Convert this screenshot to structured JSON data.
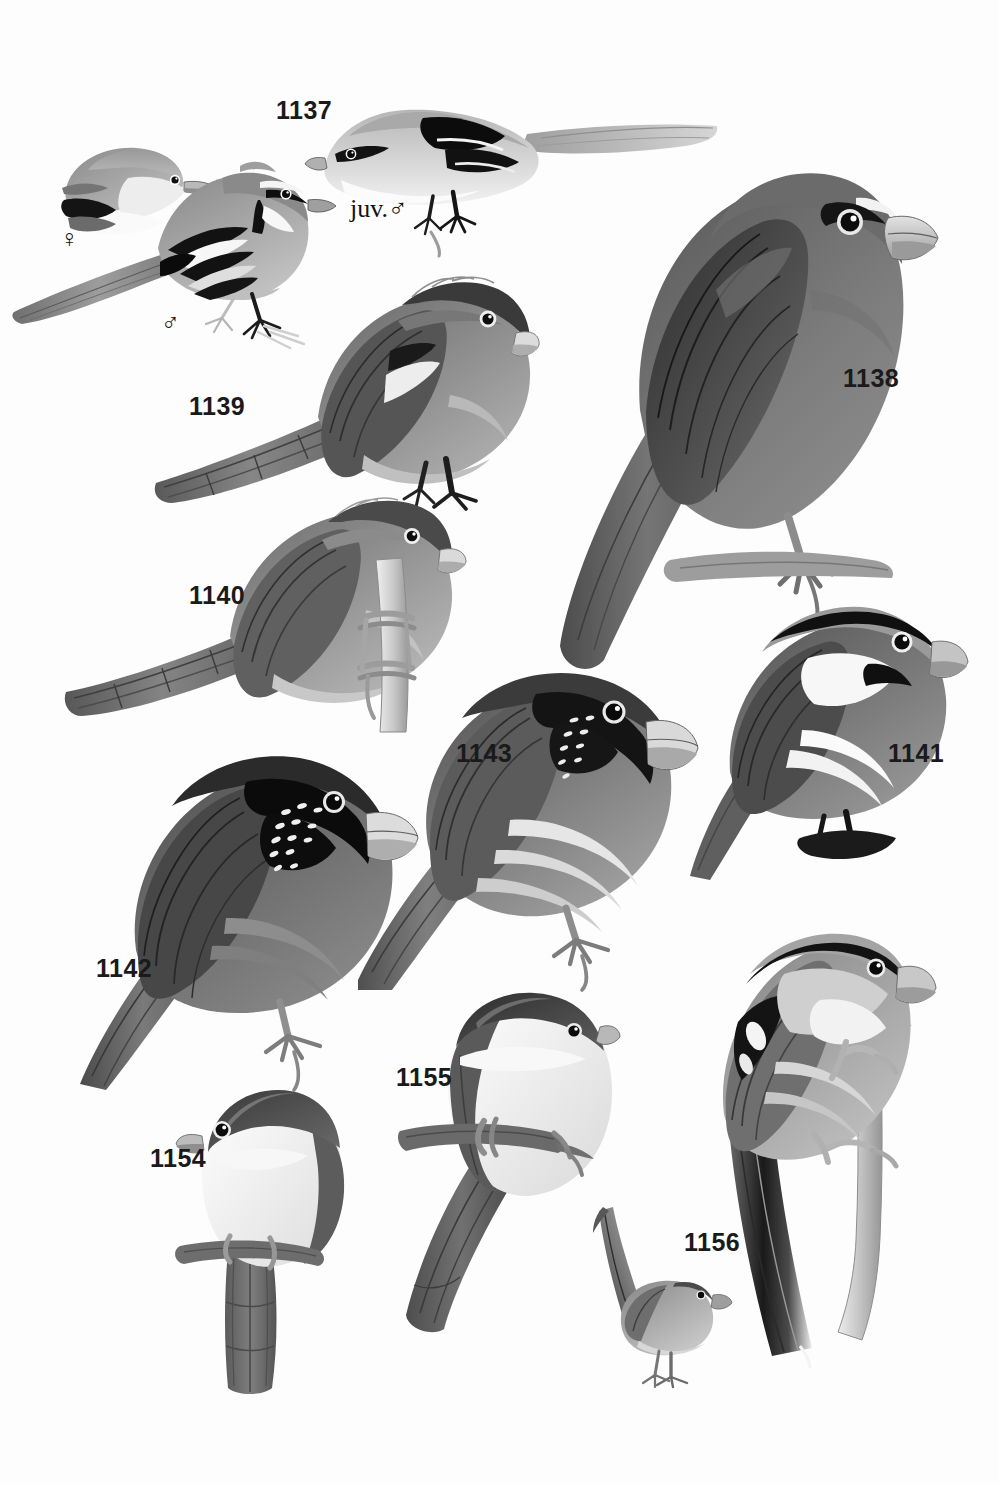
{
  "plate": {
    "type": "field-guide-illustration-plate",
    "medium": "grayscale-painted-bird-plate",
    "background_color": "#ffffff",
    "ink_color": "#1a1a1a",
    "width": 999,
    "height": 1485,
    "subject": "parrotbills and allies"
  },
  "labels": [
    {
      "id": "1137",
      "text": "1137",
      "x": 276,
      "y": 98,
      "kind": "number"
    },
    {
      "id": "1138",
      "text": "1138",
      "x": 843,
      "y": 366,
      "kind": "number"
    },
    {
      "id": "1139",
      "text": "1139",
      "x": 189,
      "y": 394,
      "kind": "number"
    },
    {
      "id": "1140",
      "text": "1140",
      "x": 189,
      "y": 583,
      "kind": "number"
    },
    {
      "id": "1141",
      "text": "1141",
      "x": 888,
      "y": 741,
      "kind": "number"
    },
    {
      "id": "1142",
      "text": "1142",
      "x": 96,
      "y": 956,
      "kind": "number"
    },
    {
      "id": "1143",
      "text": "1143",
      "x": 456,
      "y": 741,
      "kind": "number"
    },
    {
      "id": "1154",
      "text": "1154",
      "x": 150,
      "y": 1146,
      "kind": "number"
    },
    {
      "id": "1155",
      "text": "1155",
      "x": 396,
      "y": 1065,
      "kind": "number"
    },
    {
      "id": "1156",
      "text": "1156",
      "x": 684,
      "y": 1230,
      "kind": "number"
    }
  ],
  "sex_marks": [
    {
      "id": "female-1137",
      "symbol": "♀",
      "x": 60,
      "y": 226,
      "kind": "female"
    },
    {
      "id": "male-1137",
      "symbol": "♂",
      "x": 161,
      "y": 310,
      "kind": "male"
    }
  ],
  "age_marks": [
    {
      "id": "juvenile-male-1137",
      "text": "juv.♂",
      "x": 350,
      "y": 196,
      "kind": "juvenile-male"
    }
  ],
  "figures": [
    {
      "id": "fig-1137-female",
      "label_ref": "1137",
      "sex": "female",
      "description": "small pale-headed bird, head-and-shoulders only, facing right",
      "posture": "partial-portrait",
      "palette": {
        "crown": "#8c8c8c",
        "face": "#b2b2b2",
        "throat": "#f2f2f2",
        "wing": "#1a1a1a"
      }
    },
    {
      "id": "fig-1137-male",
      "label_ref": "1137",
      "sex": "male",
      "description": "long-tailed perched bird with black-and-white striped wing and black eyestripe, facing right",
      "posture": "perched-long-tail",
      "palette": {
        "upper": "#8f8f8f",
        "wing_bars": "#111111",
        "underparts": "#c9c9c9",
        "tail": "#8a8a8a"
      }
    },
    {
      "id": "fig-1137-juvenile-male",
      "label_ref": "1137",
      "sex": "juvenile-male",
      "description": "pale juvenile with bold black wing patch, long tail streaming right",
      "posture": "perched-horizontal",
      "palette": {
        "upper": "#b9b9b9",
        "wing_patch": "#0d0d0d",
        "underparts": "#efefef"
      }
    },
    {
      "id": "fig-1138",
      "label_ref": "1138",
      "description": "large dark-grey parrotbill with heavy pale bill and black eye-patch, perched on a branch facing right",
      "posture": "perched-upright",
      "palette": {
        "body": "#6e6e6e",
        "wing": "#3b3b3b",
        "bill": "#cfcfcf",
        "tail": "#5a5a5a"
      }
    },
    {
      "id": "fig-1139",
      "label_ref": "1139",
      "description": "long-tailed parrotbill with dark scaly crown, pale stubby bill, buff underparts, facing right",
      "posture": "perched-long-tail",
      "palette": {
        "crown": "#3a3a3a",
        "mantle": "#7d7d7d",
        "underparts": "#b7b7b7",
        "bill": "#d6d6d6"
      }
    },
    {
      "id": "fig-1140",
      "label_ref": "1140",
      "description": "long-tailed parrotbill gripping a vertical stem, pale throat, dark crown, facing right",
      "posture": "clinging-to-stem",
      "palette": {
        "crown": "#4a4a4a",
        "mantle": "#7a7a7a",
        "underparts": "#c0c0c0",
        "stem": "#d0d0d0"
      }
    },
    {
      "id": "fig-1141",
      "label_ref": "1141",
      "description": "grey-crowned parrotbill with black lateral crown-stripe, white cheek and black moustachial patch, white underparts",
      "posture": "perched-upright",
      "palette": {
        "crown": "#9b9b9b",
        "stripe": "#0f0f0f",
        "cheek": "#f6f6f6",
        "wing": "#4c4c4c"
      }
    },
    {
      "id": "fig-1142",
      "label_ref": "1142",
      "description": "parrotbill with black face mask and white-speckled cheek, pale yellow bill, grey body, long tail",
      "posture": "perched-upright",
      "palette": {
        "mask": "#0c0c0c",
        "speckles": "#f2f2f2",
        "body": "#7f7f7f",
        "bill": "#d8d8d8"
      }
    },
    {
      "id": "fig-1143",
      "label_ref": "1143",
      "description": "parrotbill with black-bordered face, finely streaked throat, pale creamy underparts, long tail, facing right",
      "posture": "perched-upright",
      "palette": {
        "mask": "#141414",
        "throat": "#e8e8e8",
        "mantle": "#767676",
        "bill": "#cccccc"
      }
    },
    {
      "id": "fig-1154",
      "label_ref": "1154",
      "description": "small bird with dark grey hood and clean white breast, short pale bill, long graduated tail, perched on a twig",
      "posture": "perched-front-facing",
      "palette": {
        "hood": "#474747",
        "breast": "#fbfbfb",
        "tail": "#5e5e5e",
        "twig": "#777777"
      }
    },
    {
      "id": "fig-1155",
      "label_ref": "1155",
      "description": "bird with dark crown and large white breast, long dark graduated tail, perched on a twig facing front",
      "posture": "perched-front-facing",
      "palette": {
        "crown": "#3f3f3f",
        "breast": "#fcfcfc",
        "tail": "#555555",
        "twig": "#6f6f6f"
      }
    },
    {
      "id": "fig-1156",
      "label_ref": "1156",
      "description": "tiny short-billed bird standing on the ground with tail cocked steeply upward",
      "posture": "standing-tail-cocked",
      "palette": {
        "upper": "#8b8b8b",
        "tail": "#4f4f4f",
        "underparts": "#cfcfcf"
      }
    },
    {
      "id": "fig-1156-large",
      "label_ref": "1156",
      "description": "long-tailed bird clinging to a vertical pale stem, black lateral crown-stripe, white wing flashes, very long black-and-white tail",
      "posture": "clinging-to-stem",
      "palette": {
        "crown_stripe": "#111111",
        "mantle": "#8d8d8d",
        "wing_flash": "#ffffff",
        "tail": "#3d3d3d",
        "stem": "#c7c7c7"
      }
    }
  ]
}
